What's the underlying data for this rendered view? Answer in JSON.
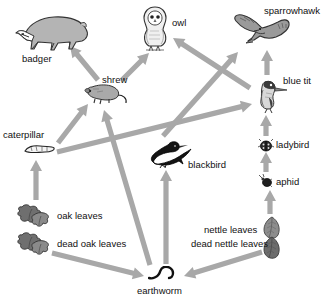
{
  "diagram": {
    "type": "food-web",
    "arrow_color": "#a8a8a8",
    "text_color": "#111111",
    "background": "#ffffff"
  },
  "nodes": [
    {
      "id": "badger",
      "label": "badger",
      "icon": "badger-illustration",
      "label_x": 22,
      "label_y": 54,
      "art_x": 14,
      "art_y": 8,
      "art_w": 76,
      "art_h": 44
    },
    {
      "id": "owl",
      "label": "owl",
      "icon": "owl-illustration",
      "label_x": 172,
      "label_y": 18,
      "art_x": 137,
      "art_y": 4,
      "art_w": 36,
      "art_h": 48
    },
    {
      "id": "sparrowhawk",
      "label": "sparrowhawk",
      "icon": "sparrowhawk-illustration",
      "label_x": 264,
      "label_y": 6,
      "art_x": 232,
      "art_y": 12,
      "art_w": 60,
      "art_h": 38
    },
    {
      "id": "shrew",
      "label": "shrew",
      "icon": "shrew-illustration",
      "label_x": 102,
      "label_y": 75,
      "art_x": 83,
      "art_y": 81,
      "art_w": 48,
      "art_h": 26
    },
    {
      "id": "blue-tit",
      "label": "blue tit",
      "icon": "blue-tit-illustration",
      "label_x": 283,
      "label_y": 76,
      "art_x": 253,
      "art_y": 76,
      "art_w": 36,
      "art_h": 38
    },
    {
      "id": "caterpillar",
      "label": "caterpillar",
      "icon": "caterpillar-illustration",
      "label_x": 3,
      "label_y": 130,
      "art_x": 22,
      "art_y": 142,
      "art_w": 34,
      "art_h": 14
    },
    {
      "id": "blackbird",
      "label": "blackbird",
      "icon": "blackbird-illustration",
      "label_x": 188,
      "label_y": 160,
      "art_x": 148,
      "art_y": 138,
      "art_w": 44,
      "art_h": 30
    },
    {
      "id": "ladybird",
      "label": "ladybird",
      "icon": "ladybird-illustration",
      "label_x": 276,
      "label_y": 140,
      "art_x": 258,
      "art_y": 138,
      "art_w": 16,
      "art_h": 14
    },
    {
      "id": "aphid",
      "label": "aphid",
      "icon": "aphid-illustration",
      "label_x": 276,
      "label_y": 177,
      "art_x": 259,
      "art_y": 174,
      "art_w": 14,
      "art_h": 14
    },
    {
      "id": "oak-leaves",
      "label": "oak leaves",
      "icon": "oak-leaves-illustration",
      "label_x": 57,
      "label_y": 211,
      "art_x": 14,
      "art_y": 203,
      "art_w": 38,
      "art_h": 26
    },
    {
      "id": "dead-oak-leaves",
      "label": "dead oak leaves",
      "icon": "dead-oak-leaves-illustration",
      "label_x": 57,
      "label_y": 239,
      "art_x": 14,
      "art_y": 231,
      "art_w": 38,
      "art_h": 26
    },
    {
      "id": "nettle-leaves",
      "label": "nettle leaves",
      "icon": "nettle-leaves-illustration",
      "label_x": 204,
      "label_y": 225,
      "art_x": 262,
      "art_y": 216,
      "art_w": 20,
      "art_h": 24
    },
    {
      "id": "dead-nettle-leaves",
      "label": "dead nettle leaves",
      "icon": "dead-nettle-leaves-illustration",
      "label_x": 191,
      "label_y": 239,
      "art_x": 262,
      "art_y": 236,
      "art_w": 20,
      "art_h": 24
    },
    {
      "id": "earthworm",
      "label": "earthworm",
      "icon": "earthworm-illustration",
      "label_x": 137,
      "label_y": 286,
      "art_x": 148,
      "art_y": 266,
      "art_w": 30,
      "art_h": 16
    }
  ],
  "links": [
    {
      "from": "shrew",
      "to": "badger",
      "x1": 98,
      "y1": 80,
      "x2": 70,
      "y2": 46
    },
    {
      "from": "shrew",
      "to": "owl",
      "x1": 122,
      "y1": 80,
      "x2": 149,
      "y2": 53
    },
    {
      "from": "blue-tit",
      "to": "owl",
      "x1": 250,
      "y1": 88,
      "x2": 173,
      "y2": 38
    },
    {
      "from": "blue-tit",
      "to": "sparrowhawk",
      "x1": 267,
      "y1": 75,
      "x2": 267,
      "y2": 50
    },
    {
      "from": "blackbird",
      "to": "sparrowhawk",
      "x1": 163,
      "y1": 136,
      "x2": 238,
      "y2": 52
    },
    {
      "from": "ladybird",
      "to": "blue-tit",
      "x1": 266,
      "y1": 136,
      "x2": 266,
      "y2": 115
    },
    {
      "from": "aphid",
      "to": "ladybird",
      "x1": 266,
      "y1": 172,
      "x2": 266,
      "y2": 152
    },
    {
      "from": "nettle-leaves",
      "to": "aphid",
      "x1": 270,
      "y1": 214,
      "x2": 270,
      "y2": 190
    },
    {
      "from": "caterpillar",
      "to": "shrew",
      "x1": 58,
      "y1": 143,
      "x2": 88,
      "y2": 104
    },
    {
      "from": "caterpillar",
      "to": "blue-tit",
      "x1": 57,
      "y1": 152,
      "x2": 252,
      "y2": 104
    },
    {
      "from": "earthworm",
      "to": "shrew",
      "x1": 150,
      "y1": 265,
      "x2": 104,
      "y2": 110
    },
    {
      "from": "earthworm",
      "to": "blackbird",
      "x1": 166,
      "y1": 264,
      "x2": 166,
      "y2": 170
    },
    {
      "from": "oak-leaves",
      "to": "caterpillar",
      "x1": 36,
      "y1": 200,
      "x2": 36,
      "y2": 160
    },
    {
      "from": "dead-oak-leaves",
      "to": "earthworm",
      "x1": 52,
      "y1": 253,
      "x2": 144,
      "y2": 276
    },
    {
      "from": "dead-nettle-leaves",
      "to": "earthworm",
      "x1": 262,
      "y1": 252,
      "x2": 184,
      "y2": 276
    }
  ]
}
